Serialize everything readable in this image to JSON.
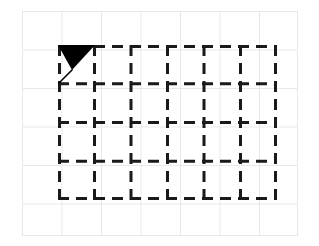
{
  "figure": {
    "title": "",
    "background_color": "#ffffff"
  },
  "background_grid": {
    "name": "graph-paper-grid",
    "line_color": "#e8e8e8",
    "line_width_px": 1,
    "origin_x_px": 22,
    "origin_y_px": 11,
    "width_px": 276,
    "height_px": 225,
    "cell_width_px": 39.5,
    "cell_height_px": 38.5,
    "columns": 7,
    "rows": 6
  },
  "dashed_grid": {
    "name": "dashed-measurement-grid",
    "line_color": "#1a1a1a",
    "line_width_px": 3,
    "dash_pattern": "11 7",
    "origin_x_px": 58,
    "origin_y_px": 45,
    "width_px": 219,
    "height_px": 155,
    "columns": 6,
    "rows": 4,
    "cell_width_px": 36.5,
    "cell_height_px": 38.75,
    "vertical_line_count": 7,
    "horizontal_line_count": 5
  },
  "marker": {
    "name": "arrowhead-marker",
    "shape": "filled-triangle-with-tail",
    "fill_color": "#000000",
    "stroke_color": "#000000",
    "direction": "down-left",
    "cell_row": 1,
    "cell_column": 1,
    "x_px": 58,
    "y_px": 44,
    "width_px": 38,
    "height_px": 40,
    "triangle_points": "0,1 37,1 14,26",
    "tail_start": "14,26",
    "tail_end": "1,39"
  }
}
